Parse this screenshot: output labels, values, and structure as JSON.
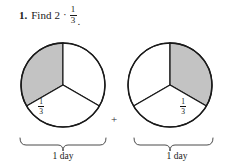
{
  "problem": {
    "number": "1.",
    "verb": "Find",
    "factor": "2",
    "operator": "·",
    "fraction": {
      "numerator": "1",
      "denominator": "3"
    },
    "period": "."
  },
  "figure": {
    "operator_between": "+",
    "colors": {
      "shaded_sector": "#c3c3c3",
      "unshaded_sector": "#ffffff",
      "outline": "#1a1a1a",
      "brace": "#4a4a4a",
      "background": "#ffffff"
    },
    "models": [
      {
        "id": "left-pie",
        "sectors": [
          {
            "id": "left-sector-shaded",
            "shaded": true,
            "label": {
              "numerator": "1",
              "denominator": "3"
            }
          },
          {
            "id": "left-sector-upper-right",
            "shaded": false,
            "label": null
          },
          {
            "id": "left-sector-bottom",
            "shaded": false,
            "label": null
          }
        ],
        "caption": "1 day"
      },
      {
        "id": "right-pie",
        "sectors": [
          {
            "id": "right-sector-upper-left",
            "shaded": false,
            "label": null
          },
          {
            "id": "right-sector-shaded",
            "shaded": true,
            "label": {
              "numerator": "1",
              "denominator": "3"
            }
          },
          {
            "id": "right-sector-bottom",
            "shaded": false,
            "label": null
          }
        ],
        "caption": "1 day"
      }
    ]
  }
}
